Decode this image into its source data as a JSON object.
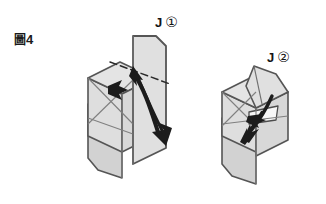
{
  "figure": {
    "label_cjk": "圖",
    "label_number": "4",
    "label_full": "圖4"
  },
  "steps": [
    {
      "id": "step-1",
      "letter": "J",
      "circled_number": "①",
      "label": "J ①"
    },
    {
      "id": "step-2",
      "letter": "J",
      "circled_number": "②",
      "label": "J ②"
    }
  ],
  "colors": {
    "paper_light": "#e2e2e2",
    "paper_mid": "#d6d6d6",
    "paper_shadow": "#c9c9c9",
    "paper_white": "#f7f7f7",
    "outline": "#555555",
    "crease": "#7a7a7a",
    "arrow": "#1c1c1c",
    "dash": "#2a2a2a",
    "background": "#ffffff",
    "text": "#141414"
  },
  "diagram": {
    "type": "origami-fold-instruction",
    "panel_count": 2,
    "arrows": {
      "step1": [
        "curved-fold-arrow",
        "straight-push-arrow",
        "dashed-fold-line"
      ],
      "step2": [
        "curved-tuck-arrow",
        "short-fold-arrow"
      ]
    }
  }
}
